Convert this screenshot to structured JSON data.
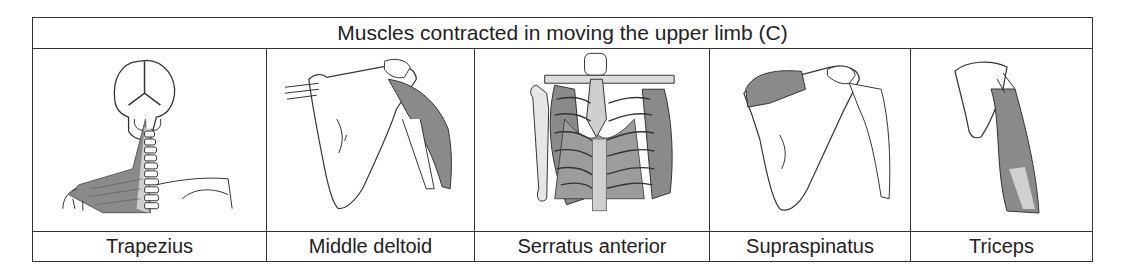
{
  "table": {
    "title": "Muscles contracted in moving the upper limb (C)",
    "columns": [
      {
        "label": "Trapezius",
        "illustration": "trapezius-illustration"
      },
      {
        "label": "Middle deltoid",
        "illustration": "middle-deltoid-illustration"
      },
      {
        "label": "Serratus anterior",
        "illustration": "serratus-anterior-illustration"
      },
      {
        "label": "Supraspinatus",
        "illustration": "supraspinatus-illustration"
      },
      {
        "label": "Triceps",
        "illustration": "triceps-illustration"
      }
    ]
  },
  "colors": {
    "border": "#333333",
    "muscle_fill": "#8a8a8a",
    "bone_fill": "#ffffff",
    "spine_fill": "#c8c8c8"
  }
}
